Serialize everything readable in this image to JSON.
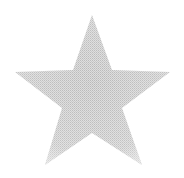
{
  "image": {
    "width": 184,
    "height": 178,
    "background_color": "#ffffff"
  },
  "star": {
    "shape": "five-point-star",
    "fill_color": "#d6d6d6",
    "texture_color": "#b8b8b8",
    "texture": "dithered-halftone",
    "points": "92,15 112,70 170,72 122,108 142,165 92,133 45,165 62,108 15,72 73,70"
  }
}
